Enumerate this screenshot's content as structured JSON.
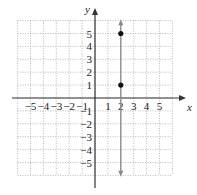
{
  "chart_data": {
    "type": "line",
    "title": "",
    "xlabel": "x",
    "ylabel": "y",
    "xlim": [
      -6,
      6
    ],
    "ylim": [
      -6,
      6
    ],
    "grid": true,
    "x_ticks": [
      -5,
      -4,
      -3,
      -2,
      -1,
      1,
      2,
      3,
      4,
      5
    ],
    "y_ticks": [
      -5,
      -4,
      -3,
      -2,
      -1,
      1,
      2,
      3,
      4,
      5
    ],
    "series": [
      {
        "name": "vertical line x = 2",
        "x": [
          2,
          2
        ],
        "y": [
          -6,
          6
        ]
      },
      {
        "name": "points",
        "type": "scatter",
        "x": [
          2,
          2
        ],
        "y": [
          5,
          1
        ]
      }
    ]
  },
  "labels": {
    "x_axis": "x",
    "y_axis": "y"
  },
  "colors": {
    "grid": "#999999",
    "axis": "#333333",
    "line": "#888888",
    "point": "#111111"
  }
}
